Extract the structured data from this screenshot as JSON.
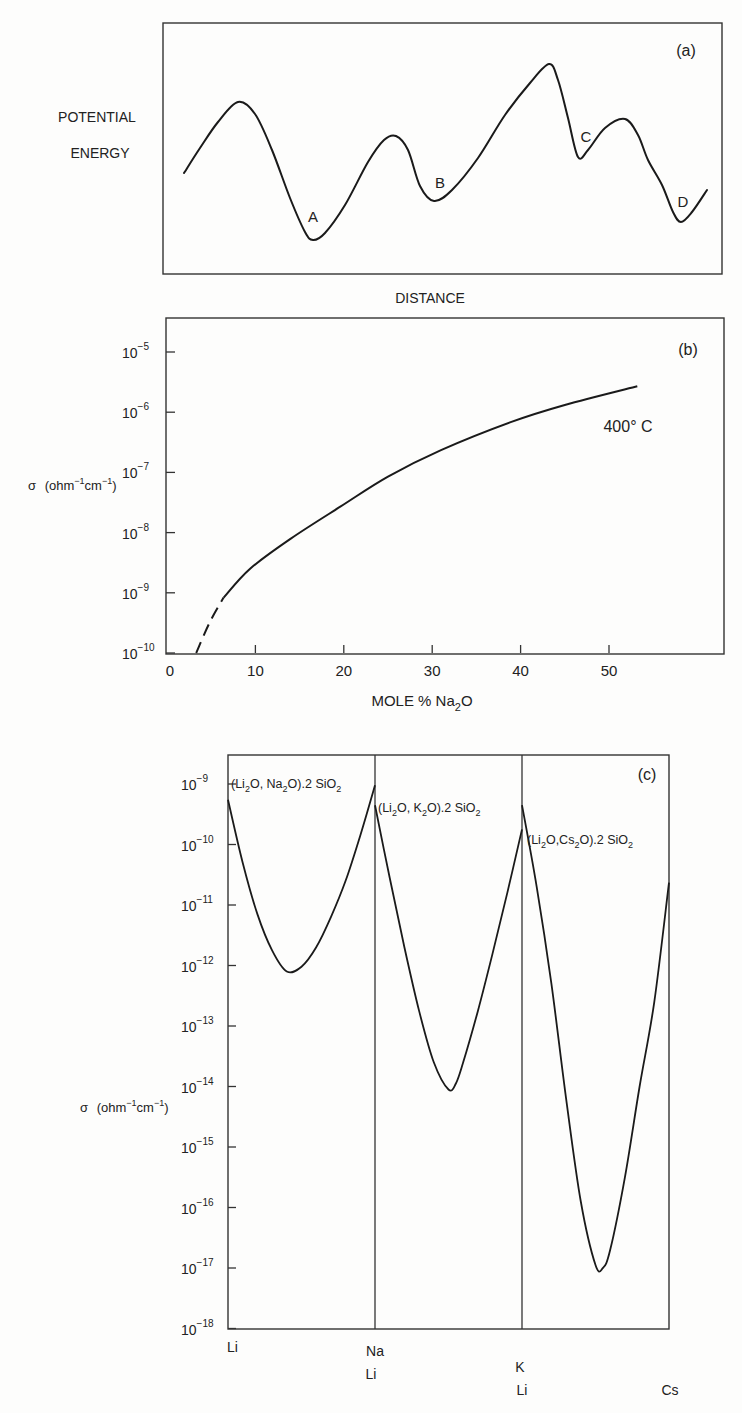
{
  "chart_data": [
    {
      "panel": "(a)",
      "type": "line",
      "title": "",
      "xlabel": "DISTANCE",
      "ylabel": [
        "POTENTIAL",
        "ENERGY"
      ],
      "grid": false,
      "description": "Schematic potential energy landscape with wells A, B, C, D",
      "wells": [
        "A",
        "B",
        "C",
        "D"
      ],
      "points_px": [
        [
          184,
          173
        ],
        [
          200,
          148
        ],
        [
          218,
          122
        ],
        [
          238,
          102
        ],
        [
          255,
          114
        ],
        [
          272,
          150
        ],
        [
          290,
          198
        ],
        [
          305,
          232
        ],
        [
          313,
          240
        ],
        [
          325,
          233
        ],
        [
          345,
          205
        ],
        [
          368,
          162
        ],
        [
          384,
          140
        ],
        [
          396,
          136
        ],
        [
          408,
          150
        ],
        [
          420,
          186
        ],
        [
          434,
          201
        ],
        [
          452,
          190
        ],
        [
          478,
          158
        ],
        [
          505,
          115
        ],
        [
          530,
          83
        ],
        [
          549,
          64
        ],
        [
          558,
          80
        ],
        [
          568,
          118
        ],
        [
          578,
          157
        ],
        [
          588,
          150
        ],
        [
          605,
          128
        ],
        [
          625,
          119
        ],
        [
          638,
          135
        ],
        [
          648,
          160
        ],
        [
          662,
          185
        ],
        [
          673,
          212
        ],
        [
          681,
          222
        ],
        [
          692,
          212
        ],
        [
          707,
          190
        ]
      ],
      "well_labels": [
        {
          "text": "A",
          "x": 313,
          "y": 222
        },
        {
          "text": "B",
          "x": 440,
          "y": 188
        },
        {
          "text": "C",
          "x": 586,
          "y": 142
        },
        {
          "text": "D",
          "x": 683,
          "y": 207
        }
      ]
    },
    {
      "panel": "(b)",
      "type": "line",
      "title": "",
      "xlabel": "MOLE % Na2O",
      "ylabel": "σ (ohm⁻¹cm⁻¹)",
      "xlim": [
        0,
        63
      ],
      "ylim_log10": [
        -10,
        -4.6
      ],
      "x_ticks": [
        0,
        10,
        20,
        30,
        40,
        50
      ],
      "y_ticks": [
        "10⁻¹⁰",
        "10⁻⁹",
        "10⁻⁸",
        "10⁻⁷",
        "10⁻⁶",
        "10⁻⁵"
      ],
      "annotation": "400° C",
      "grid": false,
      "series": [
        {
          "name": "400° C (extrapolated, dashed)",
          "style": "dashed",
          "x": [
            3.3,
            4.8,
            6.4
          ],
          "log10_sigma": [
            -10.0,
            -9.5,
            -9.08
          ]
        },
        {
          "name": "400° C",
          "style": "solid",
          "x": [
            6.4,
            9.4,
            14,
            19.6,
            25,
            31,
            38.8,
            45,
            53.2
          ],
          "log10_sigma": [
            -9.08,
            -8.6,
            -8.1,
            -7.57,
            -7.07,
            -6.63,
            -6.17,
            -5.88,
            -5.57
          ]
        }
      ]
    },
    {
      "panel": "(c)",
      "type": "line",
      "title": "",
      "xlabel": "",
      "ylabel": "σ (ohm⁻¹cm⁻¹)",
      "ylim_log10": [
        -18,
        -8.5
      ],
      "y_ticks": [
        "10⁻⁹",
        "10⁻¹⁰",
        "10⁻¹¹",
        "10⁻¹²",
        "10⁻¹³",
        "10⁻¹⁴",
        "10⁻¹⁵",
        "10⁻¹⁶",
        "10⁻¹⁷",
        "10⁻¹⁸"
      ],
      "x_tick_labels": [
        {
          "lines": [
            "Li"
          ]
        },
        {
          "lines": [
            "Na",
            "Li"
          ]
        },
        {
          "lines": [
            "K",
            "Li"
          ]
        },
        {
          "lines": [
            "Cs"
          ]
        }
      ],
      "grid": false,
      "series": [
        {
          "name": "(Li2O, Na2O).2 SiO2",
          "segment": 0,
          "fraction": [
            0,
            0.1,
            0.2,
            0.3,
            0.4,
            0.5,
            0.6,
            0.7,
            0.8,
            0.9,
            1.0
          ],
          "log10_sigma": [
            -9.26,
            -10.3,
            -11.15,
            -11.75,
            -12.1,
            -12.02,
            -11.7,
            -11.2,
            -10.6,
            -9.85,
            -9.02
          ]
        },
        {
          "name": "(Li2O, K2O).2 SiO2",
          "segment": 1,
          "fraction": [
            0,
            0.1,
            0.2,
            0.3,
            0.4,
            0.5,
            0.55,
            0.6,
            0.7,
            0.8,
            0.9,
            1.0
          ],
          "log10_sigma": [
            -9.35,
            -10.55,
            -11.7,
            -12.75,
            -13.6,
            -14.05,
            -13.95,
            -13.6,
            -12.75,
            -11.8,
            -10.8,
            -9.75
          ]
        },
        {
          "name": "(Li2O, Cs2O).2 SiO2",
          "segment": 2,
          "fraction": [
            0,
            0.1,
            0.2,
            0.3,
            0.4,
            0.5,
            0.55,
            0.6,
            0.7,
            0.8,
            0.9,
            1.0
          ],
          "log10_sigma": [
            -9.35,
            -10.7,
            -12.3,
            -14.2,
            -15.9,
            -16.95,
            -17.0,
            -16.7,
            -15.5,
            -14.0,
            -12.6,
            -10.63
          ]
        }
      ],
      "annotation": "(c)"
    }
  ],
  "panels": {
    "a": {
      "tag": "(a)",
      "ylabel_line1": "POTENTIAL",
      "ylabel_line2": "ENERGY",
      "xlabel": "DISTANCE"
    },
    "b": {
      "tag": "(b)",
      "ylabel_sigma": "σ",
      "ylabel_units_pre": "(ohm",
      "ylabel_sup1": "−1",
      "ylabel_units_mid": "cm",
      "ylabel_sup2": "−1",
      "ylabel_units_post": ")",
      "xlabel_pre": "MOLE  %  Na",
      "xlabel_sub": "2",
      "xlabel_post": "O",
      "annotation": "400° C",
      "x_ticks": [
        "0",
        "10",
        "20",
        "30",
        "40",
        "50"
      ],
      "y_exponents": [
        "−5",
        "−6",
        "−7",
        "−8",
        "−9",
        "−10"
      ]
    },
    "c": {
      "tag": "(c)",
      "ylabel_sigma": "σ",
      "ylabel_units_pre": "(ohm",
      "ylabel_sup1": "−1",
      "ylabel_units_mid": "cm",
      "ylabel_sup2": "−1",
      "ylabel_units_post": ")",
      "y_exponents": [
        "−9",
        "−10",
        "−11",
        "−12",
        "−13",
        "−14",
        "−15",
        "−16",
        "−17",
        "−18"
      ],
      "series_labels": [
        {
          "parts": [
            "(Li",
            "2",
            "O, Na",
            "2",
            "O).2 SiO",
            "2"
          ]
        },
        {
          "parts": [
            "(Li",
            "2",
            "O, K",
            "2",
            "O).2 SiO",
            "2"
          ]
        },
        {
          "parts": [
            "(Li",
            "2",
            "O,Cs",
            "2",
            "O).2 SiO",
            "2"
          ]
        }
      ],
      "x_labels": {
        "li": "Li",
        "na": "Na",
        "na_li": "Li",
        "k": "K",
        "k_li": "Li",
        "cs": "Cs"
      }
    }
  }
}
